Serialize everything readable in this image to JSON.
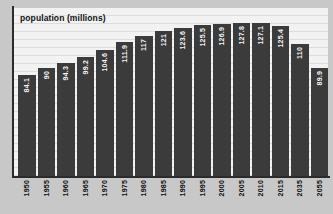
{
  "chart_data": {
    "type": "bar",
    "title": "population (millions)",
    "xlabel": "",
    "ylabel": "population (millions)",
    "categories": [
      "1950",
      "1955",
      "1960",
      "1965",
      "1970",
      "1975",
      "1980",
      "1985",
      "1990",
      "1995",
      "2000",
      "2005",
      "2010",
      "2015",
      "2035",
      "2055"
    ],
    "values": [
      84.1,
      90,
      94.3,
      99.2,
      104.6,
      111.9,
      117,
      121,
      123.6,
      125.5,
      126.9,
      127.8,
      127.1,
      125.4,
      110,
      89.9
    ],
    "value_labels": [
      "84.1",
      "90",
      "94.3",
      "99.2",
      "104.6",
      "111.9",
      "117",
      "121",
      "123.6",
      "125.5",
      "126.9",
      "127.8",
      "127.1",
      "125.4",
      "110",
      "89.9"
    ],
    "ylim": [
      0,
      140
    ],
    "grid": true,
    "legend": false,
    "bar_color": "#3b3b3b",
    "value_label_color": "#f4f4f4",
    "plot_background": "#f2f2f2",
    "axis_color": "#2b2b2b"
  }
}
